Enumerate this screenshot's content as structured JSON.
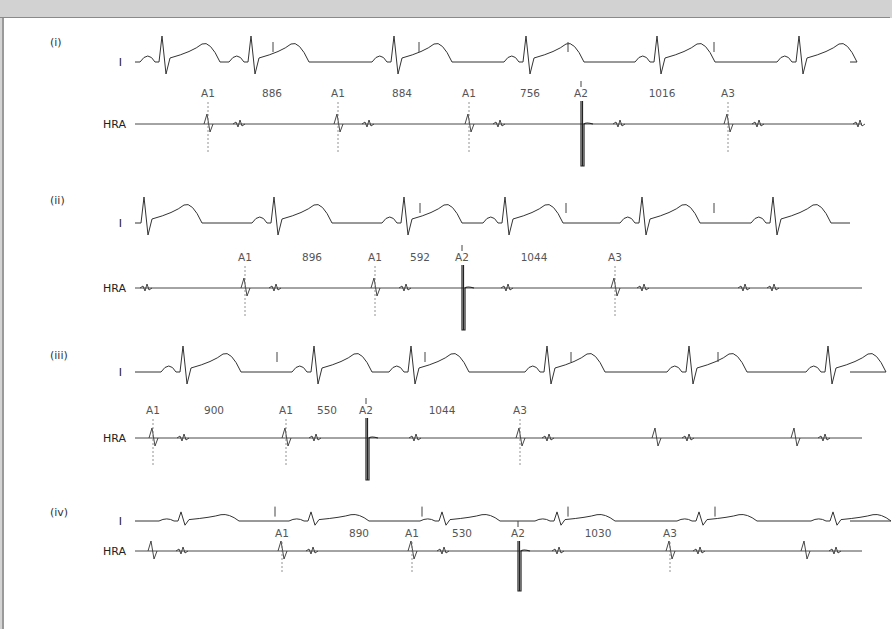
{
  "figure": {
    "colors": {
      "background": "#ffffff",
      "frame": "#d2d2d2",
      "trace": "#333333",
      "marker_text": "#555555"
    },
    "panels": [
      {
        "id": "i",
        "label": "(i)",
        "lead_top": "I",
        "lead_bottom": "HRA",
        "y": {
          "label": 42,
          "ecg": 62,
          "markers": 93,
          "hra": 124
        },
        "ecg_amp": 1.0,
        "qrs_x": [
          160,
          249,
          392,
          524,
          655,
          797
        ],
        "stim_ticks_x": [
          271,
          417,
          566,
          712
        ],
        "markers": [
          {
            "label": "A1",
            "x": 206
          },
          {
            "label": "A1",
            "x": 336
          },
          {
            "label": "A1",
            "x": 467
          },
          {
            "label": "A2",
            "x": 579
          },
          {
            "label": "A3",
            "x": 726
          }
        ],
        "intervals": [
          {
            "value": "886",
            "x": 270
          },
          {
            "value": "884",
            "x": 400
          },
          {
            "value": "756",
            "x": 528
          },
          {
            "value": "1016",
            "x": 660
          }
        ],
        "hra_far_x": [
          237,
          366,
          497,
          617,
          756,
          857
        ]
      },
      {
        "id": "ii",
        "label": "(ii)",
        "lead_top": "I",
        "lead_bottom": "HRA",
        "y": {
          "label": 200,
          "ecg": 223,
          "markers": 257,
          "hra": 288
        },
        "ecg_amp": 1.0,
        "qrs_x": [
          142,
          272,
          402,
          503,
          640,
          771
        ],
        "stim_ticks_x": [
          418,
          564,
          712
        ],
        "markers": [
          {
            "label": "A1",
            "x": 243
          },
          {
            "label": "A1",
            "x": 373
          },
          {
            "label": "A2",
            "x": 460
          },
          {
            "label": "A3",
            "x": 613
          }
        ],
        "intervals": [
          {
            "value": "896",
            "x": 310
          },
          {
            "value": "592",
            "x": 418
          },
          {
            "value": "1044",
            "x": 532
          }
        ],
        "hra_far_x": [
          144,
          273,
          403,
          505,
          641,
          742,
          771
        ]
      },
      {
        "id": "iii",
        "label": "(iii)",
        "lead_top": "I",
        "lead_bottom": "HRA",
        "y": {
          "label": 355,
          "ecg": 372,
          "markers": 410,
          "hra": 438
        },
        "ecg_amp": 1.0,
        "qrs_x": [
          181,
          312,
          409,
          545,
          687,
          826
        ],
        "stim_ticks_x": [
          275,
          423,
          569,
          716
        ],
        "markers": [
          {
            "label": "A1",
            "x": 151
          },
          {
            "label": "A1",
            "x": 284
          },
          {
            "label": "A2",
            "x": 364
          },
          {
            "label": "A3",
            "x": 518
          }
        ],
        "intervals": [
          {
            "value": "900",
            "x": 212
          },
          {
            "value": "550",
            "x": 325
          },
          {
            "value": "1044",
            "x": 440
          }
        ],
        "hra_far_x": [
          181,
          313,
          413,
          546,
          686,
          822
        ],
        "hra_extra_x": [
          654,
          793
        ]
      },
      {
        "id": "iv",
        "label": "(iv)",
        "lead_top": "I",
        "lead_bottom": "HRA",
        "y": {
          "label": 512,
          "ecg": 521,
          "markers": 533,
          "hra": 551
        },
        "ecg_amp": 0.35,
        "qrs_x": [
          179,
          309,
          440,
          555,
          697,
          831
        ],
        "stim_ticks_x": [
          273,
          420,
          566,
          713
        ],
        "markers": [
          {
            "label": "A1",
            "x": 280
          },
          {
            "label": "A1",
            "x": 410
          },
          {
            "label": "A2",
            "x": 516
          },
          {
            "label": "A3",
            "x": 668
          }
        ],
        "intervals": [
          {
            "value": "890",
            "x": 357
          },
          {
            "value": "530",
            "x": 460
          },
          {
            "value": "1030",
            "x": 596
          }
        ],
        "hra_far_x": [
          180,
          310,
          441,
          556,
          697,
          833
        ],
        "hra_extra_x": [
          150,
          803
        ]
      }
    ],
    "trace_x_range": [
      133,
      860
    ]
  }
}
